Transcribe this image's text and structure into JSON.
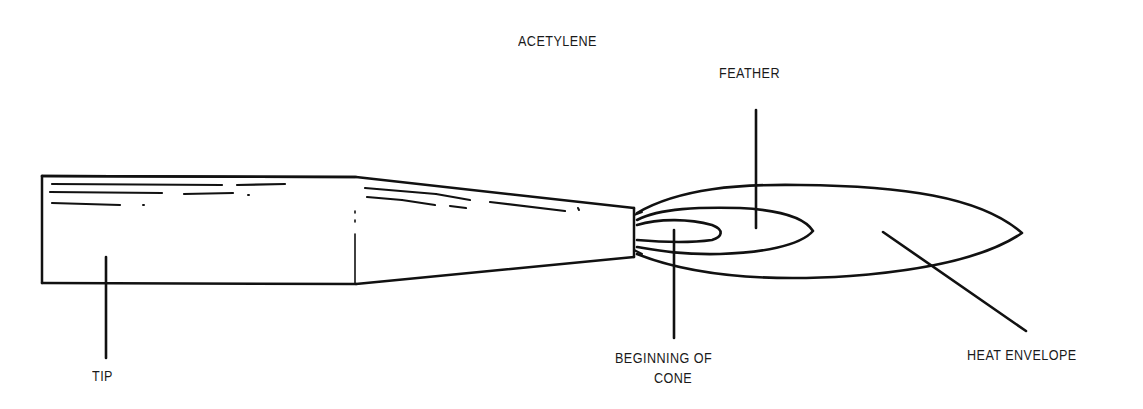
{
  "diagram": {
    "title": "ACETYLENE",
    "labels": {
      "feather": "FEATHER",
      "tip": "TIP",
      "beginning_of_cone_line1": "BEGINNING OF",
      "beginning_of_cone_line2": "CONE",
      "heat_envelope": "HEAT ENVELOPE"
    },
    "colors": {
      "stroke": "#111111",
      "background": "#ffffff",
      "text": "#1a1a1a"
    }
  }
}
